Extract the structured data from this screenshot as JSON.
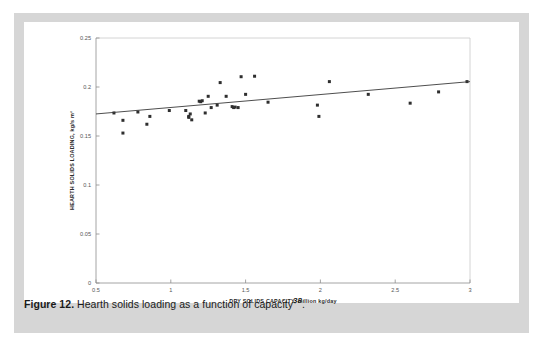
{
  "figure": {
    "label": "Figure 12.",
    "caption": " Hearth solids loading as a function of capacity",
    "reference": "38",
    "caption_end": "."
  },
  "colors": {
    "page_background": "#d6d6d6",
    "panel_background": "#ffffff",
    "axis": "#8d8d8d",
    "frame": "#c9c9c9",
    "marker": "#2e2e2e",
    "trendline": "#3a3a3a",
    "tick_text": "#555555",
    "axis_title": "#2b2b2b"
  },
  "chart_data": {
    "type": "scatter",
    "title": "",
    "xlabel": "DRY SOLIDS CAPACITY, million kg/day",
    "ylabel": "HEARTH SOLIDS LOADING, kg/s m²",
    "xlim": [
      0.5,
      3.0
    ],
    "ylim": [
      0,
      0.25
    ],
    "xticks": [
      0.5,
      1,
      1.5,
      2,
      2.5,
      3
    ],
    "xticklabels": [
      "0.5",
      "1",
      "1.5",
      "2",
      "2.5",
      "3"
    ],
    "yticks": [
      0,
      0.05,
      0.1,
      0.15,
      0.2,
      0.25
    ],
    "yticklabels": [
      "0",
      "0.05",
      "0.1",
      "0.15",
      "0.2",
      "0.25"
    ],
    "grid": false,
    "legend": null,
    "marker": "square",
    "points": [
      [
        0.62,
        0.1735
      ],
      [
        0.68,
        0.166
      ],
      [
        0.68,
        0.153
      ],
      [
        0.78,
        0.1745
      ],
      [
        0.84,
        0.162
      ],
      [
        0.86,
        0.17
      ],
      [
        0.99,
        0.176
      ],
      [
        1.1,
        0.176
      ],
      [
        1.12,
        0.17
      ],
      [
        1.12,
        0.169
      ],
      [
        1.13,
        0.1725
      ],
      [
        1.14,
        0.1665
      ],
      [
        1.19,
        0.1855
      ],
      [
        1.2,
        0.185
      ],
      [
        1.21,
        0.186
      ],
      [
        1.23,
        0.1735
      ],
      [
        1.25,
        0.1905
      ],
      [
        1.27,
        0.179
      ],
      [
        1.31,
        0.1815
      ],
      [
        1.33,
        0.2045
      ],
      [
        1.37,
        0.1905
      ],
      [
        1.41,
        0.18
      ],
      [
        1.42,
        0.179
      ],
      [
        1.43,
        0.1795
      ],
      [
        1.45,
        0.179
      ],
      [
        1.47,
        0.2105
      ],
      [
        1.5,
        0.1925
      ],
      [
        1.56,
        0.211
      ],
      [
        1.65,
        0.1845
      ],
      [
        1.98,
        0.1815
      ],
      [
        1.99,
        0.17
      ],
      [
        2.06,
        0.2055
      ],
      [
        2.32,
        0.1925
      ],
      [
        2.6,
        0.1835
      ],
      [
        2.79,
        0.195
      ],
      [
        2.98,
        0.2055
      ]
    ],
    "trendline": {
      "x": [
        0.5,
        3.0
      ],
      "y": [
        0.1725,
        0.2055
      ]
    }
  }
}
